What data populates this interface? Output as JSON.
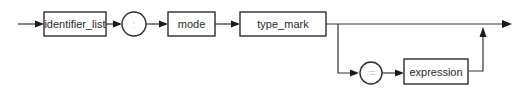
{
  "diagram": {
    "type": "syntax-railroad",
    "nodes": {
      "identifier_list": "identifier_list",
      "colon": ":",
      "mode": "mode",
      "type_mark": "type_mark",
      "assign": ":=",
      "expression": "expression"
    },
    "paths": [
      [
        "start",
        "identifier_list",
        "colon",
        "mode",
        "type_mark",
        "end"
      ],
      [
        "type_mark",
        "assign",
        "expression",
        "end"
      ]
    ],
    "colors": {
      "line": "#333333",
      "text": "#2a2a2a",
      "symbol_text": "#c8c8c8"
    }
  }
}
